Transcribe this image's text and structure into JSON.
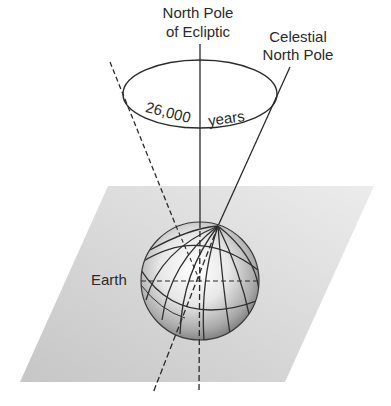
{
  "diagram": {
    "labels": {
      "ecliptic_pole_line1": "North Pole",
      "ecliptic_pole_line2": "of Ecliptic",
      "celestial_pole_line1": "Celestial",
      "celestial_pole_line2": "North Pole",
      "period_number": "26,000",
      "period_unit": "years",
      "earth": "Earth"
    },
    "colors": {
      "ink": "#2a2a2a",
      "plane_light": "#e6e6e6",
      "plane_dark": "#c4c4c4",
      "sphere_highlight": "#fafafa",
      "sphere_shadow": "#7a7a7a"
    }
  }
}
